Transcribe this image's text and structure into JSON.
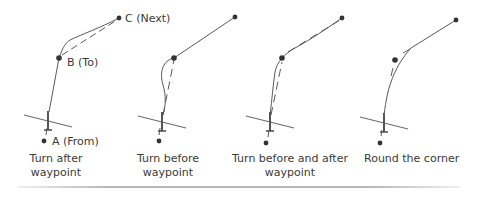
{
  "figure": {
    "type": "waypoint-turn-modes",
    "colors": {
      "line": "#5a5a5a",
      "point": "#333333",
      "text": "#3a3a3a",
      "rule": "#b8b8b8"
    },
    "point_labels": {
      "a": "A (From)",
      "b": "B (To)",
      "c": "C (Next)"
    },
    "panels": [
      {
        "id": "turn-after",
        "caption_line1": "Turn after",
        "caption_line2": "waypoint",
        "points": {
          "a": [
            49,
            141
          ],
          "b": [
            59,
            58
          ],
          "c": [
            119,
            18
          ]
        },
        "path": "actual path overshoots B, then curves back toward C",
        "dashed": "planned leg B to C"
      },
      {
        "id": "turn-before",
        "caption_line1": "Turn before",
        "caption_line2": "waypoint",
        "points": {
          "a": [
            159,
            141
          ],
          "b": [
            174,
            58
          ],
          "c": [
            235,
            17
          ]
        },
        "path": "curves inside before reaching B",
        "dashed": "planned leg A to B"
      },
      {
        "id": "turn-before-after",
        "caption_line1": "Turn before and after",
        "caption_line2": "waypoint",
        "points": {
          "a": [
            266,
            143
          ],
          "b": [
            282,
            58
          ],
          "c": [
            342,
            18
          ]
        },
        "path": "runs close to both legs through B",
        "dashed": "both planned legs"
      },
      {
        "id": "round-corner",
        "caption_line1": "Round the corner",
        "caption_line2": "",
        "points": {
          "a": [
            380,
            143
          ],
          "b": [
            395,
            60
          ],
          "c": [
            456,
            20
          ]
        },
        "path": "cuts the corner, never reaches B",
        "dashed": "short segments near corner"
      }
    ]
  }
}
